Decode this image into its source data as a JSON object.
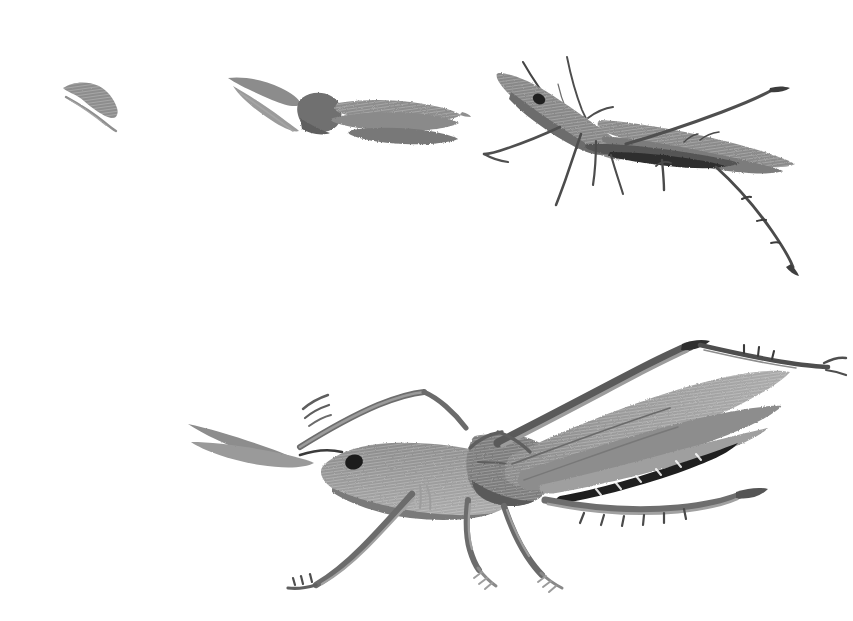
{
  "artwork": {
    "title": "Grasshopper Growth Stages",
    "medium": "ink-brush-wash-grayscale",
    "background_color": "#ffffff",
    "canvas": {
      "width": 853,
      "height": 621
    },
    "subject": "grasshopper-katydid",
    "composition": "four developmental instars, three small-to-large across the top row, one large adult below"
  },
  "palette": {
    "paper": "#ffffff",
    "wash_light": "#b9b9b9",
    "wash_mid": "#8e8e8e",
    "wash_dark": "#6a6a6a",
    "ink_line": "#4a4a4a",
    "ink_black": "#1d1d1d"
  },
  "figures": [
    {
      "id": "stage-1",
      "name": "first-instar-nymph",
      "label": "Stage 1",
      "bbox": {
        "x": 58,
        "y": 78,
        "width": 62,
        "height": 52
      },
      "description": "single diagonal brush stroke body with a thin hairline stroke beneath"
    },
    {
      "id": "stage-2",
      "name": "second-instar-nymph",
      "label": "Stage 2",
      "bbox": {
        "x": 225,
        "y": 72,
        "width": 240,
        "height": 78
      },
      "description": "wedge antennae at left, dark rounded head-thorax blob, long tapering abdomen wash to the right"
    },
    {
      "id": "stage-3",
      "name": "third-instar-nymph",
      "label": "Stage 3",
      "bbox": {
        "x": 492,
        "y": 48,
        "width": 320,
        "height": 235
      },
      "description": "head up-left with dark eye, two long antennae, folded wing wash, front and mid legs, long hind leg sweeping to lower right"
    },
    {
      "id": "stage-4",
      "name": "adult-grasshopper",
      "label": "Stage 4",
      "bbox": {
        "x": 185,
        "y": 338,
        "width": 625,
        "height": 250
      },
      "description": "full adult facing left, dark eye, antennae forward, long folded wing with dark serrated lower margin, raised hind femur and long spiny tibia, forelegs and midlegs with tarsi"
    }
  ],
  "annotations": {
    "has_text": false,
    "has_border": false,
    "note": "no captions, labels, axes or UI chrome are rendered in the image"
  }
}
